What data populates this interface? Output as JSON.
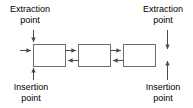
{
  "diagram": {
    "colors": {
      "background": "#ffffff",
      "stroke": "#6e6e6e",
      "node_fill": "#ffffff",
      "text": "#000000",
      "arrow": "#4a4a4a"
    },
    "labels": {
      "extraction_left": {
        "line1": "Extraction",
        "line2": "point"
      },
      "extraction_right": {
        "line1": "Extraction",
        "line2": "point"
      },
      "insertion_left": {
        "line1": "Insertion",
        "line2": "point"
      },
      "insertion_right": {
        "line1": "Insertion",
        "line2": "point"
      }
    },
    "nodes": [
      {
        "id": "node-1",
        "text": "",
        "x": 33,
        "y": 44,
        "width": 32,
        "height": 22
      },
      {
        "id": "node-2",
        "text": "",
        "x": 78,
        "y": 44,
        "width": 32,
        "height": 22
      },
      {
        "id": "node-3",
        "text": "",
        "x": 123,
        "y": 44,
        "width": 32,
        "height": 22
      }
    ],
    "connectors": [
      {
        "id": "forward-1-2",
        "direction": "right",
        "from": "node-1",
        "to": "node-2"
      },
      {
        "id": "backward-2-1",
        "direction": "left",
        "from": "node-2",
        "to": "node-1"
      },
      {
        "id": "forward-2-3",
        "direction": "right",
        "from": "node-2",
        "to": "node-3"
      },
      {
        "id": "backward-3-2",
        "direction": "left",
        "from": "node-3",
        "to": "node-2"
      }
    ],
    "endpoint_arrows": [
      {
        "id": "extraction-arrow-left",
        "direction": "down",
        "x": 33,
        "target": "node-1"
      },
      {
        "id": "entry-arrow-left",
        "direction": "right",
        "y": 55,
        "target": "node-1"
      },
      {
        "id": "insertion-arrow-left",
        "direction": "up",
        "x": 33,
        "target": "node-1"
      },
      {
        "id": "extraction-arrow-right",
        "direction": "down",
        "x": 167,
        "target": "node-3"
      },
      {
        "id": "insertion-arrow-right",
        "direction": "up",
        "x": 167,
        "target": "node-3"
      }
    ]
  }
}
